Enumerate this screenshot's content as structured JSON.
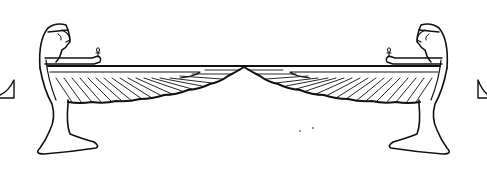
{
  "image": {
    "subject": "Two kneeling Egyptian winged goddess figures facing each other, wings outstretched meeting at center",
    "style": "black line art on white",
    "colors": {
      "background": "#ffffff",
      "ink": "#111111"
    },
    "figures": [
      {
        "name": "left-goddess",
        "facing": "right",
        "holds": "ankh"
      },
      {
        "name": "right-goddess",
        "facing": "left",
        "holds": "ankh"
      }
    ],
    "edge_fragments": [
      "left-triangle-fragment",
      "right-triangle-fragment"
    ]
  }
}
